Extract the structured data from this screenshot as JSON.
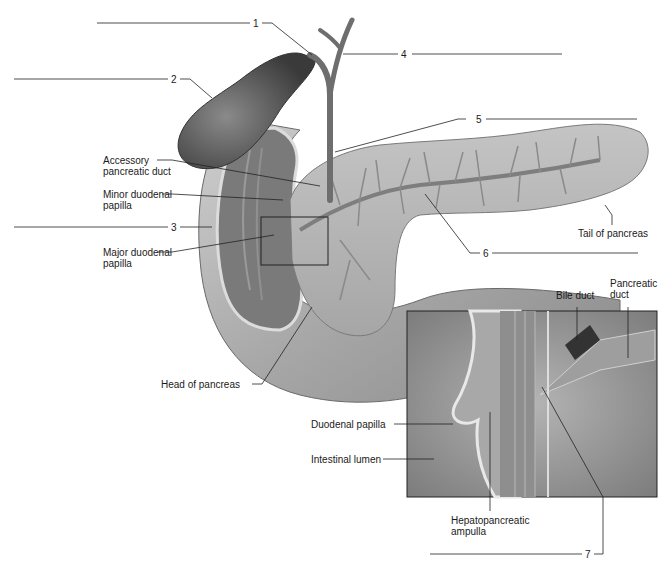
{
  "figure": {
    "numbered_blanks": [
      {
        "number": "1"
      },
      {
        "number": "2"
      },
      {
        "number": "3"
      },
      {
        "number": "4"
      },
      {
        "number": "5"
      },
      {
        "number": "6"
      },
      {
        "number": "7"
      }
    ],
    "labels": {
      "accessory_pancreatic_duct": "Accessory\npancreatic duct",
      "minor_duodenal_papilla": "Minor duodenal\npapilla",
      "major_duodenal_papilla": "Major duodenal\npapilla",
      "head_of_pancreas": "Head of pancreas",
      "tail_of_pancreas": "Tail of pancreas",
      "bile_duct": "Bile duct",
      "pancreatic_duct": "Pancreatic\nduct",
      "duodenal_papilla": "Duodenal papilla",
      "intestinal_lumen": "Intestinal lumen",
      "hepatopancreatic_ampulla": "Hepatopancreatic\nampulla"
    },
    "colors": {
      "background": "#ffffff",
      "leader_line": "#222222",
      "organ_dark": "#5a5a5a",
      "organ_mid": "#8c8c8c",
      "organ_light": "#c8c8c8",
      "inset_bg": "#9a9a9a"
    }
  }
}
